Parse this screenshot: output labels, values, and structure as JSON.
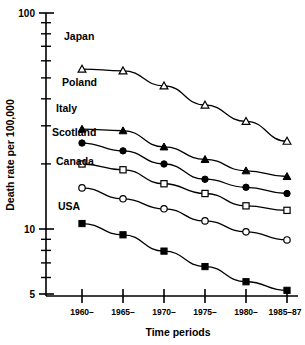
{
  "chart_data": {
    "type": "line",
    "title": "",
    "xlabel": "Time periods",
    "ylabel": "Death rate per 100,000",
    "yscale": "log",
    "ylim": [
      5,
      100
    ],
    "ytick_labels": [
      "100",
      "10",
      "5"
    ],
    "ytick_values": [
      100,
      10,
      5
    ],
    "grid": false,
    "legend_position": "inline-left-of-first-point",
    "categories": [
      "1960–",
      "1965–",
      "1970–",
      "1975–",
      "1980–",
      "1985–87"
    ],
    "series": [
      {
        "name": "Japan",
        "marker": "open-triangle",
        "values": [
          55.0,
          54.0,
          46.0,
          37.5,
          31.5,
          25.5
        ]
      },
      {
        "name": "Poland",
        "marker": "filled-triangle",
        "values": [
          29.0,
          28.5,
          24.0,
          21.0,
          18.6,
          17.5
        ]
      },
      {
        "name": "Italy",
        "marker": "filled-circle",
        "values": [
          25.0,
          23.0,
          20.0,
          17.0,
          15.6,
          14.6
        ]
      },
      {
        "name": "Scotland",
        "marker": "open-square",
        "values": [
          20.0,
          18.8,
          16.2,
          14.6,
          12.8,
          12.2
        ]
      },
      {
        "name": "Canada",
        "marker": "open-circle",
        "values": [
          15.5,
          13.8,
          12.4,
          10.9,
          9.7,
          8.9
        ]
      },
      {
        "name": "USA",
        "marker": "filled-square",
        "values": [
          10.6,
          9.4,
          7.9,
          6.7,
          5.7,
          5.2
        ]
      }
    ]
  },
  "axes": {
    "y_label": "Death rate per 100,000",
    "x_label": "Time periods",
    "y_top_label": "100",
    "y_mid_label": "10",
    "y_bottom_label": "5"
  },
  "series_labels": {
    "japan": "Japan",
    "poland": "Poland",
    "italy": "Italy",
    "scotland": "Scotland",
    "canada": "Canada",
    "usa": "USA"
  },
  "x_labels": {
    "t1": "1960–",
    "t2": "1965–",
    "t3": "1970–",
    "t4": "1975–",
    "t5": "1980–",
    "t6": "1985–87"
  }
}
